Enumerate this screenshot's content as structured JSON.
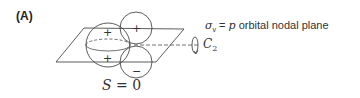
{
  "panel": {
    "label": "(A)"
  },
  "diagram": {
    "lobes": {
      "big_upper": "+",
      "big_lower": "+",
      "small_upper": "+",
      "small_lower": "−"
    }
  },
  "annotations": {
    "sigma_symbol": "σ",
    "sigma_subscript": "v",
    "equals": " = ",
    "p_symbol": "p",
    "plane_text": " orbital nodal plane",
    "c2_symbol": "C",
    "c2_subscript": "2"
  },
  "caption": {
    "variable": "S",
    "equals": " = ",
    "value": "0"
  }
}
